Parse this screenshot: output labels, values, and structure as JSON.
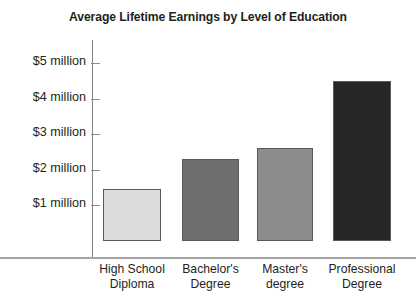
{
  "chart_data": {
    "type": "bar",
    "title": "Average Lifetime Earnings by Level of Education",
    "xlabel": "",
    "ylabel": "",
    "categories": [
      "High School Diploma",
      "Bachelor's Degree",
      "Master's degree",
      "Professional Degree"
    ],
    "category_lines": [
      [
        "High School",
        "Diploma"
      ],
      [
        "Bachelor's",
        "Degree"
      ],
      [
        "Master's",
        "degree"
      ],
      [
        "Professional",
        "Degree"
      ]
    ],
    "values": [
      1.45,
      2.3,
      2.6,
      4.5
    ],
    "value_unit": "millions of dollars",
    "ylim": [
      0,
      5.4
    ],
    "ytick_values": [
      1,
      2,
      3,
      4,
      5
    ],
    "ytick_labels": [
      "$1 million",
      "$2 million",
      "$3 million",
      "$4 million",
      "$5 million"
    ],
    "grid": false,
    "legend": "none",
    "bar_colors": [
      "#dcdcdc",
      "#6e6e6e",
      "#8c8c8c",
      "#262626"
    ],
    "bar_border_color": "#595959",
    "axis_color": "#8a8a8a",
    "text_color": "#231f20",
    "background": "#ffffff"
  }
}
